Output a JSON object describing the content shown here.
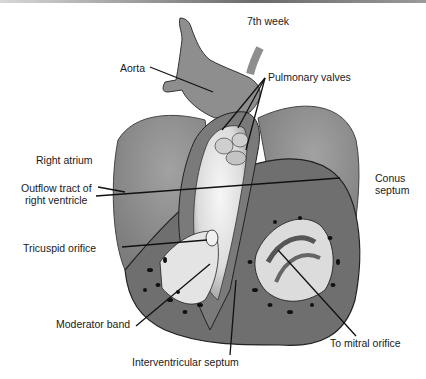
{
  "figure": {
    "title": "7th week",
    "labels": {
      "aorta": "Aorta",
      "pulmonary_valves": "Pulmonary valves",
      "right_atrium": "Right atrium",
      "outflow_tract_line1": "Outflow tract of",
      "outflow_tract_line2": "right ventricle",
      "conus_septum_line1": "Conus",
      "conus_septum_line2": "septum",
      "tricuspid_orifice": "Tricuspid orifice",
      "moderator_band": "Moderator band",
      "interventricular_septum": "Interventricular septum",
      "mitral_orifice": "To mitral orifice"
    },
    "colors": {
      "tissue_dark": "#6e6e6e",
      "tissue_mid": "#8c8c8c",
      "tissue_light": "#b4b4b4",
      "lumen": "#eeeeee",
      "leader": "#111111"
    }
  }
}
